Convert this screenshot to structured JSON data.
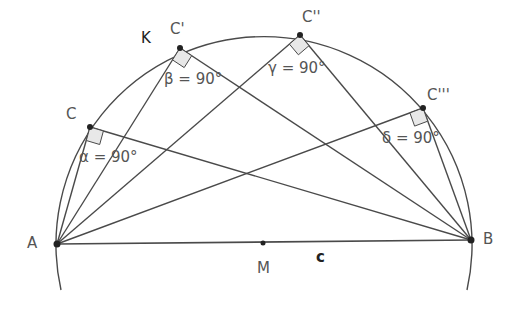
{
  "diagram": {
    "colors": {
      "line": "#4a4a4a",
      "point": "#222222",
      "right_angle_fill": "#e8e8e8",
      "label": "#555555"
    },
    "circle": {
      "name": "k",
      "label": "K",
      "center": "M"
    },
    "segment": {
      "name": "c",
      "label": "c",
      "from": "A",
      "to": "B"
    },
    "points": [
      {
        "id": "A",
        "label": "A",
        "x": 57,
        "y": 244
      },
      {
        "id": "B",
        "label": "B",
        "x": 471,
        "y": 240
      },
      {
        "id": "M",
        "label": "M",
        "x": 263,
        "y": 243
      },
      {
        "id": "C1",
        "label": "C",
        "x": 90,
        "y": 127
      },
      {
        "id": "C2",
        "label": "C'",
        "x": 180,
        "y": 48
      },
      {
        "id": "C3",
        "label": "C''",
        "x": 300,
        "y": 35
      },
      {
        "id": "C4",
        "label": "C'''",
        "x": 423,
        "y": 108
      }
    ],
    "angles": [
      {
        "vertex": "C",
        "label": "α = 90°"
      },
      {
        "vertex": "C'",
        "label": "β = 90°"
      },
      {
        "vertex": "C''",
        "label": "γ = 90°"
      },
      {
        "vertex": "C'''",
        "label": "δ = 90°"
      }
    ]
  }
}
